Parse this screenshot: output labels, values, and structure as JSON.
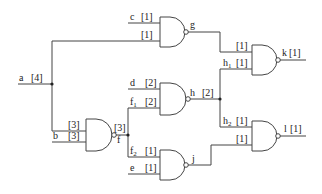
{
  "diagram": {
    "type": "logic-circuit",
    "gate_type": "NAND",
    "labels": {
      "a": "a",
      "a_width": "[4]",
      "b": "b",
      "b_width": "[3]",
      "c": "c",
      "c_width": "[1]",
      "d": "d",
      "d_width": "[2]",
      "e": "e",
      "e_width": "[1]",
      "f": "f",
      "f_width": "[3]",
      "f1": "f",
      "f1_sub": "1",
      "f1_width": "[2]",
      "f2": "f",
      "f2_sub": "2",
      "f2_width": "[1]",
      "g": "g",
      "g_in2_width": "[1]",
      "nand1_a_width": "[3]",
      "h": "h",
      "h_width": "[2]",
      "h1": "h",
      "h1_sub": "1",
      "h1_width": "[1]",
      "h2": "h",
      "h2_sub": "2",
      "h2_width": "[1]",
      "j": "j",
      "k_g_width": "[1]",
      "l_j_width": "[1]",
      "k": "k",
      "k_width": "[1]",
      "l": "l",
      "l_width": "[1]"
    },
    "gates": [
      {
        "id": "G1",
        "type": "NAND",
        "inputs": [
          "a[3]",
          "b[3]"
        ],
        "output": "f"
      },
      {
        "id": "G2",
        "type": "NAND",
        "inputs": [
          "c[1]",
          "a[1]"
        ],
        "output": "g"
      },
      {
        "id": "G3",
        "type": "NAND",
        "inputs": [
          "d[2]",
          "f1[2]"
        ],
        "output": "h"
      },
      {
        "id": "G4",
        "type": "NAND",
        "inputs": [
          "f2[1]",
          "e[1]"
        ],
        "output": "j"
      },
      {
        "id": "G5",
        "type": "NAND",
        "inputs": [
          "g[1]",
          "h1[1]"
        ],
        "output": "k"
      },
      {
        "id": "G6",
        "type": "NAND",
        "inputs": [
          "h2[1]",
          "j[1]"
        ],
        "output": "l"
      }
    ]
  }
}
